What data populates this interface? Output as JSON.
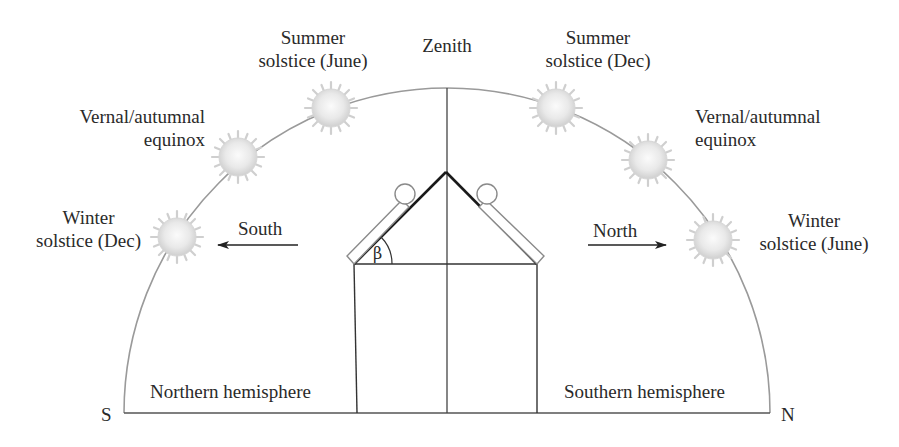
{
  "labels": {
    "zenith": "Zenith",
    "summer_june_l1": "Summer",
    "summer_june_l2": "solstice (June)",
    "summer_dec_l1": "Summer",
    "summer_dec_l2": "solstice (Dec)",
    "equinox_left_l1": "Vernal/autumnal",
    "equinox_left_l2": "equinox",
    "equinox_right_l1": "Vernal/autumnal",
    "equinox_right_l2": "equinox",
    "winter_dec_l1": "Winter",
    "winter_dec_l2": "solstice (Dec)",
    "winter_june_l1": "Winter",
    "winter_june_l2": "solstice (June)",
    "south_arrow": "South",
    "north_arrow": "North",
    "northern_hemisphere": "Northern hemisphere",
    "southern_hemisphere": "Southern hemisphere",
    "s_marker": "S",
    "n_marker": "N",
    "tilt_angle": "β"
  },
  "colors": {
    "arc": "#9a9a9a",
    "lines": "#444444",
    "roof": "#1a1a1a",
    "panel": "#8a8a8a",
    "sun": "#e8e8e8",
    "text": "#2a2a2a"
  },
  "suns": [
    {
      "name": "sun-winter-solstice-dec",
      "cx": 177,
      "cy": 237
    },
    {
      "name": "sun-equinox-left",
      "cx": 237,
      "cy": 158
    },
    {
      "name": "sun-summer-solstice-june",
      "cx": 329,
      "cy": 108
    },
    {
      "name": "sun-summer-solstice-dec",
      "cx": 556,
      "cy": 108
    },
    {
      "name": "sun-equinox-right",
      "cx": 648,
      "cy": 160
    },
    {
      "name": "sun-winter-solstice-june",
      "cx": 713,
      "cy": 240
    }
  ]
}
